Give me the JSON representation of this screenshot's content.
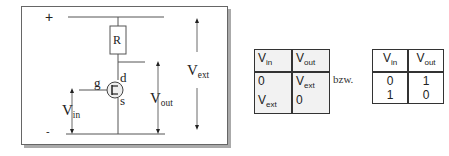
{
  "circuit": {
    "plus_label": "+",
    "minus_label": "-",
    "resistor_label": "R",
    "gate_label": "g",
    "drain_label": "d",
    "source_label": "s",
    "vin": {
      "main": "V",
      "sub": "in"
    },
    "vout": {
      "main": "V",
      "sub": "out"
    },
    "vext": {
      "main": "V",
      "sub": "ext"
    }
  },
  "table1": {
    "headers": [
      {
        "main": "V",
        "sub": "in"
      },
      {
        "main": "V",
        "sub": "out"
      }
    ],
    "rows": [
      [
        {
          "main": "0",
          "sub": ""
        },
        {
          "main": "V",
          "sub": "ext"
        }
      ],
      [
        {
          "main": "V",
          "sub": "ext"
        },
        {
          "main": "0",
          "sub": ""
        }
      ]
    ]
  },
  "separator": "bzw.",
  "table2": {
    "headers": [
      {
        "main": "V",
        "sub": "in"
      },
      {
        "main": "V",
        "sub": "out"
      }
    ],
    "rows": [
      [
        "0",
        "1"
      ],
      [
        "1",
        "0"
      ]
    ]
  }
}
